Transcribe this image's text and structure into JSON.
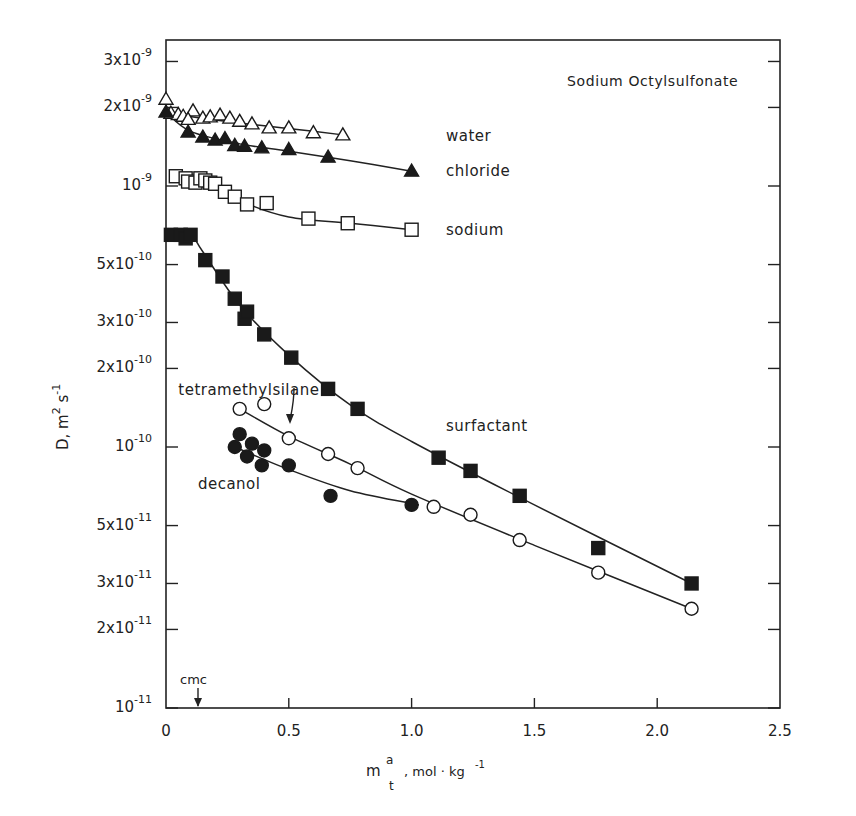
{
  "chart_data": {
    "type": "scatter",
    "title": "Sodium Octylsulfonate",
    "xlabel": "m_t^a , mol·kg^-1",
    "ylabel": "D, m^2 s^-1",
    "xscale": "linear",
    "yscale": "log",
    "xlim": [
      0,
      2.5
    ],
    "ylim": [
      1e-11,
      4e-09
    ],
    "grid": false,
    "legend_position": "inline labels at right of curves",
    "x_ticks": [
      {
        "value": 0,
        "label": "0"
      },
      {
        "value": 0.5,
        "label": "0.5"
      },
      {
        "value": 1.0,
        "label": "1.0"
      },
      {
        "value": 1.5,
        "label": "1.5"
      },
      {
        "value": 2.0,
        "label": "2.0"
      },
      {
        "value": 2.5,
        "label": "2.5"
      }
    ],
    "y_ticks": [
      {
        "value": 3e-09,
        "mant": "3x10",
        "exp": "-9"
      },
      {
        "value": 2e-09,
        "mant": "2x10",
        "exp": "-9"
      },
      {
        "value": 1e-09,
        "mant": "10",
        "exp": "-9"
      },
      {
        "value": 5e-10,
        "mant": "5x10",
        "exp": "-10"
      },
      {
        "value": 3e-10,
        "mant": "3x10",
        "exp": "-10"
      },
      {
        "value": 2e-10,
        "mant": "2x10",
        "exp": "-10"
      },
      {
        "value": 1e-10,
        "mant": "10",
        "exp": "-10"
      },
      {
        "value": 5e-11,
        "mant": "5x10",
        "exp": "-11"
      },
      {
        "value": 3e-11,
        "mant": "3x10",
        "exp": "-11"
      },
      {
        "value": 2e-11,
        "mant": "2x10",
        "exp": "-11"
      },
      {
        "value": 1e-11,
        "mant": "10",
        "exp": "-11"
      }
    ],
    "annotations": [
      {
        "text": "cmc",
        "x": 0.13,
        "type": "arrow-down-to-axis"
      },
      {
        "text": "tetramethylsilane",
        "type": "arrow-to-curve",
        "target_x": 0.5
      }
    ],
    "series": [
      {
        "name": "water",
        "marker": "triangle-open",
        "label": "water",
        "label_pos": [
          1.14,
          1.55e-09
        ],
        "x": [
          0.0,
          0.02,
          0.05,
          0.07,
          0.11,
          0.09,
          0.15,
          0.18,
          0.22,
          0.26,
          0.3,
          0.35,
          0.42,
          0.5,
          0.6,
          0.72
        ],
        "y": [
          2.15e-09,
          1.9e-09,
          1.88e-09,
          1.85e-09,
          1.94e-09,
          1.8e-09,
          1.82e-09,
          1.84e-09,
          1.87e-09,
          1.82e-09,
          1.77e-09,
          1.73e-09,
          1.67e-09,
          1.67e-09,
          1.6e-09,
          1.57e-09
        ],
        "curve": [
          [
            0.0,
            1.9e-09
          ],
          [
            0.2,
            1.79e-09
          ],
          [
            0.4,
            1.7e-09
          ],
          [
            0.6,
            1.62e-09
          ],
          [
            0.72,
            1.57e-09
          ]
        ]
      },
      {
        "name": "chloride",
        "marker": "triangle-filled",
        "label": "chloride",
        "label_pos": [
          1.14,
          1.14e-09
        ],
        "x": [
          0.0,
          0.09,
          0.15,
          0.2,
          0.24,
          0.28,
          0.32,
          0.39,
          0.5,
          0.66,
          1.0
        ],
        "y": [
          1.92e-09,
          1.61e-09,
          1.54e-09,
          1.5e-09,
          1.52e-09,
          1.43e-09,
          1.42e-09,
          1.4e-09,
          1.38e-09,
          1.29e-09,
          1.14e-09
        ],
        "curve": [
          [
            0.0,
            1.92e-09
          ],
          [
            0.1,
            1.62e-09
          ],
          [
            0.3,
            1.45e-09
          ],
          [
            0.5,
            1.36e-09
          ],
          [
            0.75,
            1.25e-09
          ],
          [
            1.0,
            1.14e-09
          ]
        ]
      },
      {
        "name": "sodium",
        "marker": "square-open",
        "label": "sodium",
        "label_pos": [
          1.14,
          6.8e-10
        ],
        "x": [
          0.04,
          0.08,
          0.09,
          0.12,
          0.14,
          0.16,
          0.18,
          0.2,
          0.24,
          0.28,
          0.33,
          0.41,
          0.58,
          0.74,
          1.0
        ],
        "y": [
          1.09e-09,
          1.07e-09,
          1.04e-09,
          1.03e-09,
          1.07e-09,
          1.05e-09,
          1.03e-09,
          1.02e-09,
          9.5e-10,
          9.1e-10,
          8.5e-10,
          8.6e-10,
          7.5e-10,
          7.2e-10,
          6.8e-10
        ],
        "curve": [
          [
            0.04,
            1.09e-09
          ],
          [
            0.2,
            1.02e-09
          ],
          [
            0.3,
            8.8e-10
          ],
          [
            0.5,
            7.6e-10
          ],
          [
            0.75,
            7.2e-10
          ],
          [
            1.0,
            6.8e-10
          ]
        ]
      },
      {
        "name": "surfactant",
        "marker": "square-filled",
        "label": "surfactant",
        "label_pos": [
          1.14,
          1.2e-10
        ],
        "x": [
          0.02,
          0.06,
          0.08,
          0.1,
          0.16,
          0.23,
          0.28,
          0.32,
          0.33,
          0.4,
          0.51,
          0.66,
          0.78,
          1.11,
          1.24,
          1.44,
          1.76,
          2.14
        ],
        "y": [
          6.5e-10,
          6.5e-10,
          6.3e-10,
          6.5e-10,
          5.2e-10,
          4.5e-10,
          3.7e-10,
          3.1e-10,
          3.3e-10,
          2.7e-10,
          2.2e-10,
          1.67e-10,
          1.4e-10,
          9.1e-11,
          8.1e-11,
          6.5e-11,
          4.1e-11,
          3e-11
        ],
        "curve": [
          [
            0.02,
            6.6e-10
          ],
          [
            0.1,
            6.5e-10
          ],
          [
            0.15,
            5.6e-10
          ],
          [
            0.3,
            3.5e-10
          ],
          [
            0.5,
            2.25e-10
          ],
          [
            0.75,
            1.45e-10
          ],
          [
            1.0,
            1.05e-10
          ],
          [
            1.5,
            6e-11
          ],
          [
            2.14,
            3e-11
          ]
        ]
      },
      {
        "name": "tetramethylsilane",
        "marker": "circle-open",
        "label": "tetramethylsilane",
        "label_pos": [
          0.05,
          1.65e-10
        ],
        "x": [
          0.3,
          0.4,
          0.5,
          0.66,
          0.78,
          1.09,
          1.24,
          1.44,
          1.76,
          2.14
        ],
        "y": [
          1.4e-10,
          1.46e-10,
          1.08e-10,
          9.4e-11,
          8.3e-11,
          5.9e-11,
          5.5e-11,
          4.4e-11,
          3.3e-11,
          2.4e-11
        ],
        "curve": [
          [
            0.3,
            1.4e-10
          ],
          [
            0.5,
            1.1e-10
          ],
          [
            0.75,
            8.6e-11
          ],
          [
            1.0,
            6.6e-11
          ],
          [
            1.5,
            4.2e-11
          ],
          [
            2.14,
            2.4e-11
          ]
        ]
      },
      {
        "name": "decanol",
        "marker": "circle-filled",
        "label": "decanol",
        "label_pos": [
          0.13,
          7.2e-11
        ],
        "x": [
          0.3,
          0.28,
          0.35,
          0.33,
          0.4,
          0.39,
          0.5,
          0.67,
          1.0
        ],
        "y": [
          1.12e-10,
          1e-10,
          1.03e-10,
          9.2e-11,
          9.7e-11,
          8.5e-11,
          8.5e-11,
          6.5e-11,
          6e-11
        ],
        "curve": [
          [
            0.28,
            1e-10
          ],
          [
            0.5,
            8.2e-11
          ],
          [
            0.75,
            6.8e-11
          ],
          [
            1.03,
            6e-11
          ]
        ]
      }
    ]
  }
}
